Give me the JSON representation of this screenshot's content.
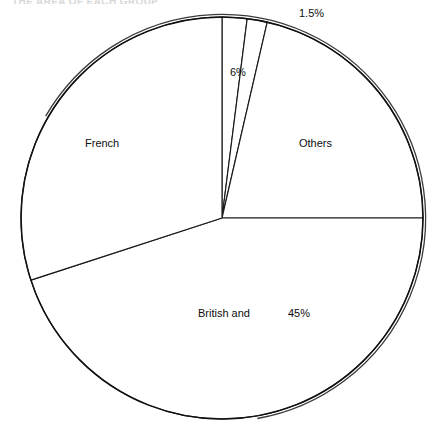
{
  "figure": {
    "clipped_header_text": "THE AREA OF EACH GROUP",
    "background_color": "#ffffff",
    "line_color": "#111111"
  },
  "chart_data": {
    "type": "pie",
    "title": "",
    "subtitle": "",
    "xlabel": "",
    "ylabel": "",
    "grid": false,
    "legend_position": "none",
    "start_angle_deg": 90,
    "direction": "clockwise",
    "categories": [
      "6%",
      "1.5%",
      "Others",
      "British and",
      "French"
    ],
    "values": [
      6,
      1.5,
      17.5,
      45,
      30
    ],
    "slices": [
      {
        "name": "six-percent-slice",
        "label": "6%",
        "value": 6,
        "value_label": "6%",
        "start_deg": 0,
        "end_deg": 7.2,
        "fill": "#ffffff",
        "stroke": "#1a1a1a"
      },
      {
        "name": "one-point-five-percent-slice",
        "label": "1.5%",
        "value": 1.5,
        "value_label": "1.5%",
        "start_deg": 7.2,
        "end_deg": 13.0,
        "fill": "#ffffff",
        "stroke": "#1a1a1a"
      },
      {
        "name": "others-slice",
        "label": "Others",
        "value": 17.5,
        "value_label": "",
        "start_deg": 13.0,
        "end_deg": 90.0,
        "fill": "#ffffff",
        "stroke": "#1a1a1a"
      },
      {
        "name": "british-and-slice",
        "label": "British and",
        "value": 45,
        "value_label": "45%",
        "start_deg": 90.0,
        "end_deg": 252.0,
        "fill": "#ffffff",
        "stroke": "#1a1a1a"
      },
      {
        "name": "french-slice",
        "label": "French",
        "value": 30,
        "value_label": "",
        "start_deg": 252.0,
        "end_deg": 360.0,
        "fill": "#ffffff",
        "stroke": "#1a1a1a"
      }
    ],
    "annotations": [
      {
        "name": "french-label",
        "text": "French",
        "x": 85,
        "y": 137
      },
      {
        "name": "six-percent-label",
        "text": "6%",
        "x": 230,
        "y": 66
      },
      {
        "name": "one-five-label",
        "text": "1.5%",
        "x": 299,
        "y": 7
      },
      {
        "name": "others-label",
        "text": "Others",
        "x": 299,
        "y": 137
      },
      {
        "name": "british-label",
        "text": "British and",
        "x": 198,
        "y": 307
      },
      {
        "name": "forty-five-label",
        "text": "45%",
        "x": 288,
        "y": 307
      }
    ],
    "geometry": {
      "center_x": 222,
      "center_y": 218,
      "radius": 201
    }
  }
}
